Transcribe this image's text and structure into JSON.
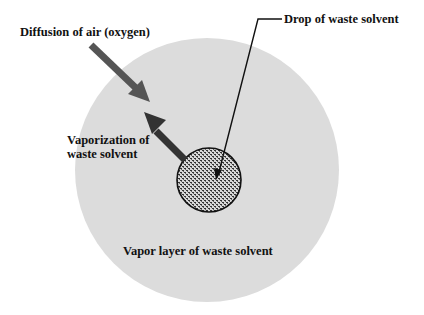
{
  "diagram": {
    "labels": {
      "diffusion": "Diffusion of air (oxygen)",
      "drop": "Drop of waste solvent",
      "vaporization_line1": "Vaporization of",
      "vaporization_line2": "waste solvent",
      "vapor_layer": "Vapor layer of waste solvent"
    },
    "colors": {
      "background": "#ffffff",
      "vapor_layer": "#dcdcdc",
      "drop_fill": "#cfcfcf",
      "drop_pattern": "#333333",
      "arrow_air": "#555555",
      "arrow_vapor": "#333333",
      "text": "#111111"
    }
  }
}
